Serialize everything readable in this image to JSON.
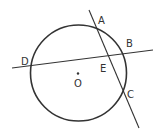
{
  "diagram": {
    "type": "circle-geometry",
    "stroke_color": "#333333",
    "background": "#ffffff",
    "points": {
      "A": "A",
      "B": "B",
      "C": "C",
      "D": "D",
      "E": "E",
      "O": "O"
    },
    "elements": [
      {
        "kind": "circle",
        "center": "O"
      },
      {
        "kind": "line",
        "through": [
          "A",
          "E",
          "C"
        ]
      },
      {
        "kind": "line",
        "through": [
          "D",
          "E",
          "B"
        ]
      },
      {
        "kind": "point",
        "name": "O",
        "marker": "dot"
      }
    ]
  }
}
